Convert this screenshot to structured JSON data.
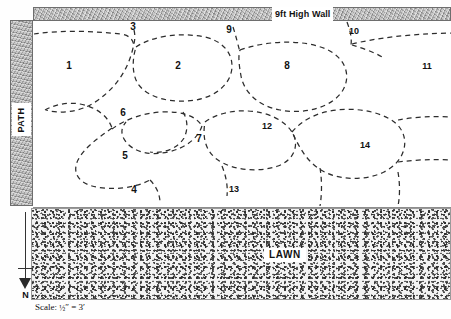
{
  "plan": {
    "title": "Garden planting plan",
    "wall": {
      "label": "9ft High Wall"
    },
    "path": {
      "label": "PATH"
    },
    "lawn": {
      "label": "LAWN"
    },
    "compass": {
      "label": "N",
      "direction": "down"
    },
    "scale": {
      "prefix": "Scale:",
      "numerator": "1",
      "denominator": "2",
      "unit_drawing": "″",
      "equals": "=",
      "ground": "3′",
      "full_text": "Scale: ½″ = 3′"
    },
    "beds": [
      {
        "id": 1,
        "label": "1",
        "x": 69,
        "y": 66
      },
      {
        "id": 2,
        "label": "2",
        "x": 178,
        "y": 66
      },
      {
        "id": 3,
        "label": "3",
        "x": 133,
        "y": 27
      },
      {
        "id": 4,
        "label": "4",
        "x": 134,
        "y": 190
      },
      {
        "id": 5,
        "label": "5",
        "x": 125,
        "y": 156
      },
      {
        "id": 6,
        "label": "6",
        "x": 123,
        "y": 113
      },
      {
        "id": 7,
        "label": "7",
        "x": 199,
        "y": 139
      },
      {
        "id": 8,
        "label": "8",
        "x": 287,
        "y": 66
      },
      {
        "id": 9,
        "label": "9",
        "x": 229,
        "y": 30
      },
      {
        "id": 10,
        "label": "10",
        "x": 354,
        "y": 31
      },
      {
        "id": 11,
        "label": "11",
        "x": 427,
        "y": 66
      },
      {
        "id": 12,
        "label": "12",
        "x": 267,
        "y": 126
      },
      {
        "id": 13,
        "label": "13",
        "x": 234,
        "y": 189
      },
      {
        "id": 14,
        "label": "14",
        "x": 365,
        "y": 145
      }
    ],
    "bed_outlines": [
      "M 34 34 C 60 30, 95 31, 120 34 C 130 35, 133 40, 134 46",
      "M 134 30 C 136 38, 134 44, 132 52 C 126 74, 112 92, 92 104 C 78 112, 60 114, 46 110",
      "M 136 47 C 152 36, 180 32, 205 37 C 222 41, 232 52, 232 66 C 232 82, 218 96, 196 100 C 172 104, 148 98, 138 84 C 132 74, 132 60, 136 47",
      "M 233 27 C 236 36, 238 45, 240 52",
      "M 240 50 C 268 40, 305 39, 328 50 C 346 59, 351 76, 343 90 C 333 107, 305 115, 280 110 C 258 106, 244 92, 241 76 C 239 65, 238 56, 240 50",
      "M 347 22 C 350 30, 352 38, 351 45",
      "M 352 44 C 376 38, 410 34, 451 33",
      "M 352 45 C 362 48, 374 52, 384 58",
      "M 45 110 C 56 104, 68 102, 80 104 C 96 107, 108 116, 112 128",
      "M 112 128 C 98 138, 84 148, 78 160 C 72 172, 78 182, 92 186 C 110 191, 136 188, 150 180",
      "M 112 129 C 124 120, 142 113, 162 112 C 182 111, 196 116, 202 126",
      "M 202 126 C 198 138, 186 148, 168 152 C 150 156, 134 152, 126 142 C 120 134, 121 128, 126 122",
      "M 183 112 C 188 120, 188 130, 184 138 C 178 148, 164 154, 150 152",
      "M 205 122 C 216 114, 232 110, 248 111 C 268 112, 284 120, 292 132 C 300 145, 294 160, 278 166 C 258 173, 232 170, 218 160 C 206 152, 202 138, 205 122",
      "M 222 166 C 226 176, 228 186, 227 196",
      "M 150 180 C 156 186, 160 194, 160 203",
      "M 292 132 C 302 120, 318 112, 336 110 C 362 107, 390 114, 400 128 C 410 142, 404 162, 384 172 C 364 182, 334 180, 318 168 C 304 158, 298 144, 292 132",
      "M 398 120 C 414 117, 432 116, 451 117",
      "M 398 162 C 414 160, 432 159, 451 160",
      "M 320 168 C 322 180, 322 194, 320 206",
      "M 398 172 C 400 184, 400 196, 398 206"
    ]
  }
}
